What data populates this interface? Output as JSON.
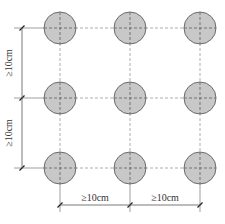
{
  "diagram": {
    "type": "circle-grid-spacing",
    "rows": 3,
    "columns": 3,
    "circle_fill": "#c8c8c8",
    "circle_stroke": "#6b6b6b",
    "grid_line_color": "#9a9a9a",
    "dimension_line_color": "#555555",
    "dimensions": {
      "vertical": [
        {
          "label": "≥10cm"
        },
        {
          "label": "≥10cm"
        }
      ],
      "horizontal": [
        {
          "label": "≥10cm"
        },
        {
          "label": "≥10cm"
        }
      ]
    }
  }
}
